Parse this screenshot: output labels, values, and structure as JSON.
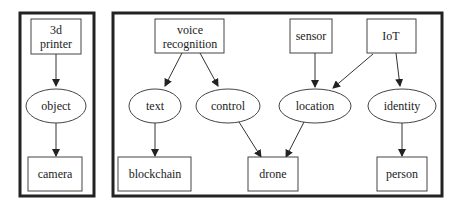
{
  "panels": [
    {
      "id": "left",
      "nodes": [
        {
          "id": "printer",
          "shape": "box",
          "lines": [
            "3d",
            "printer"
          ]
        },
        {
          "id": "object",
          "shape": "ellipse",
          "lines": [
            "object"
          ]
        },
        {
          "id": "camera",
          "shape": "box",
          "lines": [
            "camera"
          ]
        }
      ],
      "edges": [
        [
          "printer",
          "object"
        ],
        [
          "object",
          "camera"
        ]
      ]
    },
    {
      "id": "right",
      "nodes": [
        {
          "id": "voice",
          "shape": "box",
          "lines": [
            "voice",
            "recognition"
          ]
        },
        {
          "id": "sensor",
          "shape": "box",
          "lines": [
            "sensor"
          ]
        },
        {
          "id": "iot",
          "shape": "box",
          "lines": [
            "IoT"
          ]
        },
        {
          "id": "text",
          "shape": "ellipse",
          "lines": [
            "text"
          ]
        },
        {
          "id": "control",
          "shape": "ellipse",
          "lines": [
            "control"
          ]
        },
        {
          "id": "location",
          "shape": "ellipse",
          "lines": [
            "location"
          ]
        },
        {
          "id": "identity",
          "shape": "ellipse",
          "lines": [
            "identity"
          ]
        },
        {
          "id": "blockchain",
          "shape": "box",
          "lines": [
            "blockchain"
          ]
        },
        {
          "id": "drone",
          "shape": "box",
          "lines": [
            "drone"
          ]
        },
        {
          "id": "person",
          "shape": "box",
          "lines": [
            "person"
          ]
        }
      ],
      "edges": [
        [
          "voice",
          "text"
        ],
        [
          "voice",
          "control"
        ],
        [
          "sensor",
          "location"
        ],
        [
          "iot",
          "location"
        ],
        [
          "iot",
          "identity"
        ],
        [
          "text",
          "blockchain"
        ],
        [
          "control",
          "drone"
        ],
        [
          "location",
          "drone"
        ],
        [
          "identity",
          "person"
        ]
      ]
    }
  ],
  "labels": {
    "printer_1": "3d",
    "printer_2": "printer",
    "object": "object",
    "camera": "camera",
    "voice_1": "voice",
    "voice_2": "recognition",
    "sensor": "sensor",
    "iot": "IoT",
    "text": "text",
    "control": "control",
    "location": "location",
    "identity": "identity",
    "blockchain": "blockchain",
    "drone": "drone",
    "person": "person"
  }
}
